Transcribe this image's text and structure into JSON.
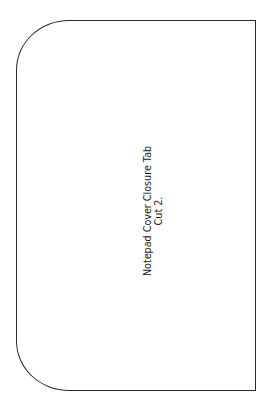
{
  "template": {
    "shape": "rounded-left rectangle cut outline",
    "stroke_color": "#2b2b2b",
    "background_color": "#ffffff",
    "label": {
      "line1": "Notepad Cover Closure Tab",
      "line2": "Cut 2.",
      "orientation": "rotated -90deg"
    }
  }
}
